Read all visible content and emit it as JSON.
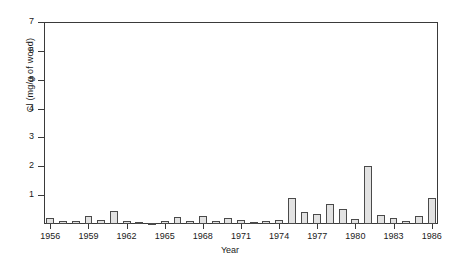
{
  "chart_data": {
    "type": "bar",
    "title": "",
    "xlabel": "Year",
    "ylabel": "Cl (mg/g of wood)",
    "ylim": [
      0,
      7
    ],
    "xlim": [
      1955.5,
      1986.5
    ],
    "grid": false,
    "legend": null,
    "y_ticks": [
      1,
      2,
      3,
      4,
      5,
      6,
      7
    ],
    "y_tick_labels": [
      "1",
      "2",
      "3",
      "4",
      "5",
      "6",
      "7"
    ],
    "x_ticks": [
      1956,
      1959,
      1962,
      1965,
      1968,
      1971,
      1974,
      1977,
      1980,
      1983,
      1986
    ],
    "x_tick_labels": [
      "1956",
      "1959",
      "1962",
      "1965",
      "1968",
      "1971",
      "1974",
      "1977",
      "1980",
      "1983",
      "1986"
    ],
    "bar_color": "#e2e2e2",
    "bar_edge_color": "#4a4a4a",
    "categories": [
      1956,
      1957,
      1958,
      1959,
      1960,
      1961,
      1962,
      1963,
      1964,
      1965,
      1966,
      1967,
      1968,
      1969,
      1970,
      1971,
      1972,
      1973,
      1974,
      1975,
      1976,
      1977,
      1978,
      1979,
      1980,
      1981,
      1982,
      1983,
      1984,
      1985,
      1986
    ],
    "values": [
      0.22,
      0.12,
      0.1,
      0.26,
      0.13,
      0.45,
      0.12,
      0.07,
      0.05,
      0.1,
      0.24,
      0.12,
      0.26,
      0.09,
      0.22,
      0.13,
      0.08,
      0.09,
      0.13,
      0.9,
      0.42,
      0.33,
      0.7,
      0.52,
      0.17,
      2.0,
      0.3,
      0.22,
      0.12,
      0.28,
      0.9
    ]
  },
  "chart_series_full": {
    "years": [
      1956,
      1957,
      1958,
      1959,
      1960,
      1961,
      1962,
      1963,
      1964,
      1965,
      1966,
      1967,
      1968,
      1969,
      1970,
      1971,
      1972,
      1973,
      1974,
      1975,
      1976,
      1977,
      1978,
      1979,
      1980,
      1981,
      1982,
      1983,
      1984,
      1985,
      1986
    ],
    "values": [
      0.22,
      0.12,
      0.1,
      0.26,
      0.13,
      0.45,
      0.12,
      0.07,
      0.05,
      0.1,
      0.24,
      0.12,
      0.26,
      0.09,
      0.22,
      0.13,
      0.08,
      0.09,
      0.13,
      0.9,
      0.42,
      0.33,
      0.7,
      0.52,
      0.17,
      2.0,
      0.3,
      0.22,
      0.12,
      0.28,
      0.9
    ]
  },
  "axis": {
    "y_label": "Cl (mg/g of wood)",
    "x_label": "Year"
  }
}
